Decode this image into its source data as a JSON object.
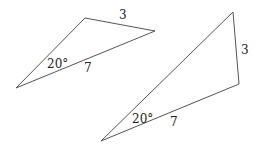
{
  "diagram": {
    "triangles": [
      {
        "id": "triangle-1",
        "vertices": [
          [
            16,
            88
          ],
          [
            85,
            18
          ],
          [
            155,
            31
          ]
        ],
        "labels": {
          "side_top": "3",
          "side_bottom": "7",
          "angle": "20°"
        }
      },
      {
        "id": "triangle-2",
        "vertices": [
          [
            101,
            141
          ],
          [
            233,
            12
          ],
          [
            239,
            84
          ]
        ],
        "labels": {
          "side_right": "3",
          "side_bottom": "7",
          "angle": "20°"
        }
      }
    ]
  }
}
